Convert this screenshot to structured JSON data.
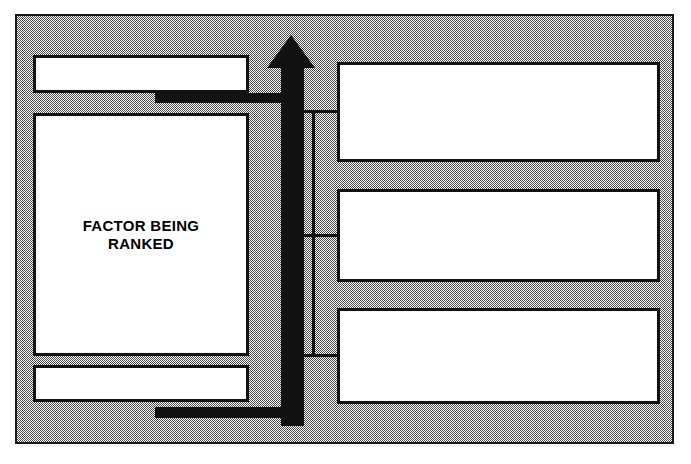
{
  "diagram": {
    "colors": {
      "frame_fill": "#808080",
      "line": "#121212",
      "box_fill": "#ffffff",
      "text": "#000000"
    },
    "left_column": {
      "top_box": {
        "label": "",
        "name": "upper-blank-box"
      },
      "main_box": {
        "label": "FACTOR BEING\nRANKED",
        "line1": "FACTOR BEING",
        "line2": "RANKED"
      },
      "bottom_box": {
        "label": "",
        "name": "lower-blank-box"
      }
    },
    "right_column": {
      "boxes": [
        {
          "label": ""
        },
        {
          "label": ""
        },
        {
          "label": ""
        }
      ]
    },
    "arrow": {
      "direction": "up",
      "name": "ranking-scale-arrow"
    },
    "connectors": {
      "top_bar": "",
      "bottom_bar": "",
      "branch_1": "",
      "branch_2": "",
      "branch_3": ""
    }
  }
}
